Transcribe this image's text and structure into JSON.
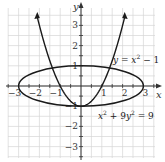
{
  "chart_data": {
    "type": "line",
    "title": "",
    "xlabel": "x",
    "ylabel": "y",
    "xlim": [
      -3.5,
      3.5
    ],
    "ylim": [
      -3.5,
      3.8
    ],
    "grid": true,
    "grid_step": 0.5,
    "x_ticks": [
      -3,
      -2,
      -1,
      1,
      2,
      3
    ],
    "y_ticks": [
      -3,
      -2,
      -1,
      1,
      2,
      3
    ],
    "x_tick_labels": [
      "−3",
      "−2",
      "−1",
      "1",
      "2",
      "3"
    ],
    "y_tick_labels": [
      "−3",
      "−2",
      "−1",
      "1",
      "2",
      "3"
    ],
    "series": [
      {
        "name": "y = x² − 1",
        "kind": "parabola",
        "equation": "y = x^2 - 1",
        "x_range": [
          -2.1,
          2.1
        ],
        "arrows": true,
        "points": [
          [
            -2.1,
            3.41
          ],
          [
            -2,
            3
          ],
          [
            -1.5,
            1.25
          ],
          [
            -1,
            0
          ],
          [
            -0.5,
            -0.75
          ],
          [
            0,
            -1
          ],
          [
            0.5,
            -0.75
          ],
          [
            1,
            0
          ],
          [
            1.5,
            1.25
          ],
          [
            2,
            3
          ],
          [
            2.1,
            3.41
          ]
        ]
      },
      {
        "name": "x² + 9y² = 9",
        "kind": "ellipse",
        "equation": "x^2 + 9y^2 = 9",
        "center": [
          0,
          0
        ],
        "semi_axes": [
          3,
          1
        ],
        "points": [
          [
            -3,
            0
          ],
          [
            0,
            1
          ],
          [
            3,
            0
          ],
          [
            0,
            -1
          ]
        ]
      }
    ],
    "annotations": [
      {
        "text": "y = x² − 1",
        "position": [
          1.7,
          1.5
        ]
      },
      {
        "text": "x² + 9y² = 9",
        "position": [
          1.0,
          -1.6
        ]
      }
    ],
    "intersections": [
      [
        0,
        -1
      ],
      [
        -1.13,
        0.28
      ],
      [
        1.13,
        0.28
      ]
    ]
  },
  "labels": {
    "x_axis": "x",
    "y_axis": "y",
    "parabola_label_y": "y",
    "parabola_label_eq": " = ",
    "parabola_label_x": "x",
    "parabola_label_exp": "2",
    "parabola_label_rest": " − 1",
    "ellipse_label_x": "x",
    "ellipse_label_exp1": "2",
    "ellipse_label_mid": " + 9",
    "ellipse_label_y": "y",
    "ellipse_label_exp2": "2",
    "ellipse_label_rest": " = 9"
  },
  "colors": {
    "curve": "#1a1a1a",
    "axis": "#333333",
    "grid": "#d6d6d6"
  }
}
